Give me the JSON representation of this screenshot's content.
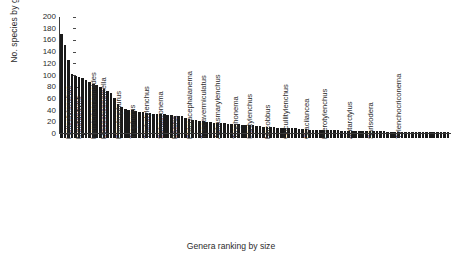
{
  "chart_data": {
    "type": "bar",
    "title": "",
    "xlabel": "Genera ranking by size",
    "ylabel": "No. species by genus",
    "ylim": [
      0,
      200
    ],
    "yticks": [
      200,
      180,
      160,
      140,
      120,
      100,
      80,
      60,
      40,
      20,
      0
    ],
    "grid": false,
    "legend": null,
    "bar_color": "#1a1a1a",
    "axis_color": "#3a3a3a",
    "n_bars": 110,
    "categories": [
      "Helicotylenchus",
      "",
      "",
      "Meloidogyne",
      "",
      "",
      "Hemicriconemoides",
      "",
      "",
      "Discocriconemella",
      "",
      "",
      "Paratrophurus",
      "",
      "",
      "Trophurus",
      "",
      "",
      "Trichotylenchus",
      "",
      "",
      "Sphaeronema",
      "",
      "",
      "Basiria",
      "",
      "",
      "Pateracephalanema",
      "",
      "",
      "Thecavermiculatus",
      "",
      "",
      "Aphasmarylenchus",
      "",
      "",
      "Trophonema",
      "",
      "",
      "Irantylenchus",
      "",
      "",
      "Nacobbus",
      "",
      "",
      "Cucullitylenchus",
      "",
      "",
      "Gracilancea",
      "",
      "",
      "Pterotylenchus",
      "",
      "",
      "Antarctylus",
      "",
      "",
      "Sarisodera",
      "",
      "",
      "Tylenchocriconema",
      "",
      "",
      "",
      "",
      "",
      "",
      "",
      "",
      "",
      "",
      "",
      "",
      "",
      "",
      "",
      "",
      "",
      "",
      "",
      "",
      "",
      "",
      "",
      "",
      "",
      "",
      "",
      "",
      "",
      "",
      "",
      "",
      "",
      "",
      "",
      "",
      "",
      "",
      "",
      "",
      "",
      "",
      "",
      "",
      "",
      "",
      "",
      "",
      ""
    ],
    "labeled_genera": [
      {
        "index": 0,
        "name": "Helicotylenchus"
      },
      {
        "index": 3,
        "name": "Meloidogyne"
      },
      {
        "index": 7,
        "name": "Hemicriconemoides"
      },
      {
        "index": 10,
        "name": "Discocriconemella"
      },
      {
        "index": 14,
        "name": "Paratrophurus"
      },
      {
        "index": 18,
        "name": "Trophurus"
      },
      {
        "index": 22,
        "name": "Trichotylenchus"
      },
      {
        "index": 26,
        "name": "Sphaeronema"
      },
      {
        "index": 30,
        "name": "Basiria"
      },
      {
        "index": 34,
        "name": "Pateracephalanema"
      },
      {
        "index": 38,
        "name": "Thecavermiculatus"
      },
      {
        "index": 42,
        "name": "Aphasmarylenchus"
      },
      {
        "index": 47,
        "name": "Trophonema"
      },
      {
        "index": 51,
        "name": "Irantylenchus"
      },
      {
        "index": 56,
        "name": "Nacobbus"
      },
      {
        "index": 61,
        "name": "Cucullitylenchus"
      },
      {
        "index": 67,
        "name": "Gracilancea"
      },
      {
        "index": 72,
        "name": "Pterotylenchus"
      },
      {
        "index": 79,
        "name": "Antarctylus"
      },
      {
        "index": 85,
        "name": "Sarisodera"
      },
      {
        "index": 93,
        "name": "Tylenchocriconema"
      }
    ],
    "values": [
      170,
      152,
      126,
      101,
      99,
      97,
      94,
      91,
      88,
      85,
      82,
      79,
      76,
      73,
      69,
      61,
      50,
      45,
      42,
      40,
      39,
      38,
      37,
      36,
      35,
      34,
      33,
      33,
      32,
      32,
      31,
      31,
      30,
      30,
      29,
      26,
      24,
      23,
      22,
      21,
      20,
      19,
      19,
      18,
      18,
      17,
      17,
      16,
      16,
      15,
      15,
      14,
      14,
      13,
      13,
      12,
      12,
      11,
      11,
      10,
      10,
      9,
      9,
      9,
      8,
      8,
      8,
      7,
      7,
      7,
      6,
      6,
      6,
      6,
      5,
      5,
      5,
      5,
      5,
      4,
      4,
      4,
      4,
      4,
      4,
      3,
      3,
      3,
      3,
      3,
      3,
      3,
      2,
      2,
      2,
      2,
      2,
      2,
      2,
      2,
      2,
      1,
      1,
      1,
      1,
      1,
      1,
      1,
      1,
      1
    ]
  }
}
